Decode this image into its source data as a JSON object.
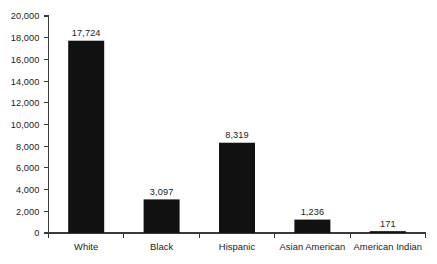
{
  "chart_data": {
    "type": "bar",
    "title": "",
    "subtitle": "",
    "xlabel": "",
    "ylabel": "",
    "categories": [
      "White",
      "Black",
      "Hispanic",
      "Asian American",
      "American Indian"
    ],
    "values": [
      17724,
      3097,
      8319,
      1236,
      171
    ],
    "value_labels": [
      "17,724",
      "3,097",
      "8,319",
      "1,236",
      "171"
    ],
    "ylim": [
      0,
      20000
    ],
    "ytick_values": [
      0,
      2000,
      4000,
      6000,
      8000,
      10000,
      12000,
      14000,
      16000,
      18000,
      20000
    ],
    "ytick_labels": [
      "0",
      "2,000",
      "4,000",
      "6,000",
      "8,000",
      "10,000",
      "12,000",
      "14,000",
      "16,000",
      "18,000",
      "20,000"
    ],
    "grid": false,
    "legend": false,
    "legend_position": "none",
    "bar_color": "#111111",
    "axis_color": "#3a3a3a",
    "text_color": "#1a1a1a",
    "background_color": "#ffffff"
  }
}
